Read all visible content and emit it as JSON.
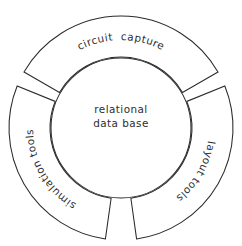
{
  "diagram": {
    "type": "ring-hub-and-spoke",
    "background_color": "#ffffff",
    "stroke_color": "#2b2b2b",
    "text_color": "#2d2d2d",
    "hub": {
      "label_line1": "relational",
      "label_line2": "data base",
      "center_x": 121,
      "center_y": 128,
      "radius": 70
    },
    "ring": {
      "center_x": 121,
      "center_y": 128,
      "inner_radius": 71,
      "outer_radius": 112,
      "gap_degrees": 6
    },
    "segments": [
      {
        "id": "circuit-capture",
        "label": "circuit  capture",
        "position": "top",
        "start_angle": -150,
        "end_angle": -30,
        "text_direction": "clockwise"
      },
      {
        "id": "layout-tools",
        "label": "layout tools",
        "position": "right",
        "start_angle": -22,
        "end_angle": 82,
        "text_direction": "clockwise"
      },
      {
        "id": "simulation-tools",
        "label": "simulation tools",
        "position": "left",
        "start_angle": 98,
        "end_angle": 202,
        "text_direction": "clockwise"
      }
    ]
  }
}
